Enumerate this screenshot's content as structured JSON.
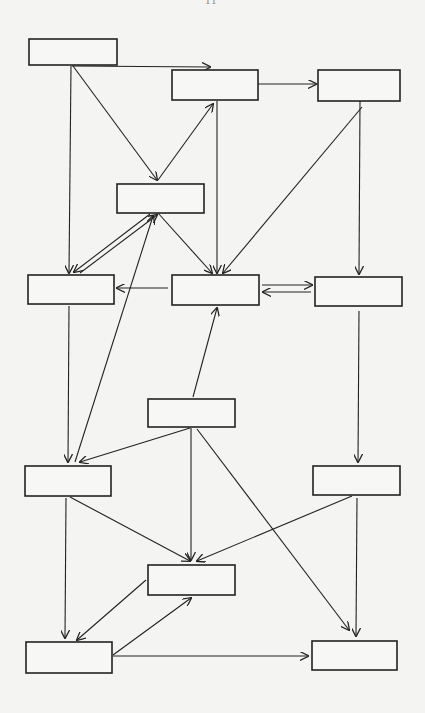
{
  "page_mark": "11",
  "diagram": {
    "type": "flow-diagram",
    "colors": {
      "background": "#f4f4f2",
      "stroke": "#222222",
      "box_fill": "#f7f7f5"
    },
    "nodes": [
      {
        "id": "A",
        "label": "",
        "x": 29,
        "y": 39,
        "w": 88,
        "h": 26
      },
      {
        "id": "B",
        "label": "",
        "x": 172,
        "y": 70,
        "w": 86,
        "h": 30
      },
      {
        "id": "C",
        "label": "",
        "x": 318,
        "y": 70,
        "w": 82,
        "h": 31
      },
      {
        "id": "D",
        "label": "",
        "x": 117,
        "y": 184,
        "w": 87,
        "h": 29
      },
      {
        "id": "E",
        "label": "",
        "x": 28,
        "y": 275,
        "w": 86,
        "h": 29
      },
      {
        "id": "F",
        "label": "",
        "x": 172,
        "y": 275,
        "w": 87,
        "h": 30
      },
      {
        "id": "G",
        "label": "",
        "x": 315,
        "y": 277,
        "w": 87,
        "h": 29
      },
      {
        "id": "M",
        "label": "",
        "x": 148,
        "y": 399,
        "w": 87,
        "h": 28
      },
      {
        "id": "H",
        "label": "",
        "x": 25,
        "y": 466,
        "w": 86,
        "h": 30
      },
      {
        "id": "R",
        "label": "",
        "x": 313,
        "y": 466,
        "w": 87,
        "h": 29
      },
      {
        "id": "N",
        "label": "",
        "x": 148,
        "y": 565,
        "w": 87,
        "h": 30
      },
      {
        "id": "BL",
        "label": "",
        "x": 26,
        "y": 642,
        "w": 86,
        "h": 31
      },
      {
        "id": "BR",
        "label": "",
        "x": 312,
        "y": 641,
        "w": 85,
        "h": 29
      }
    ],
    "edges": [
      {
        "from": "A",
        "to": "B",
        "x1": 72,
        "y1": 66,
        "x2": 210,
        "y2": 67
      },
      {
        "from": "A",
        "to": "D",
        "x1": 73,
        "y1": 66,
        "x2": 157,
        "y2": 180
      },
      {
        "from": "A",
        "to": "E",
        "x1": 71,
        "y1": 66,
        "x2": 69,
        "y2": 273
      },
      {
        "from": "D",
        "to": "B",
        "x1": 158,
        "y1": 180,
        "x2": 213,
        "y2": 104
      },
      {
        "from": "B",
        "to": "C",
        "x1": 258,
        "y1": 84,
        "x2": 316,
        "y2": 84
      },
      {
        "from": "B",
        "to": "F",
        "x1": 217,
        "y1": 101,
        "x2": 217,
        "y2": 273
      },
      {
        "from": "C",
        "to": "F",
        "x1": 362,
        "y1": 107,
        "x2": 223,
        "y2": 273
      },
      {
        "from": "C",
        "to": "G",
        "x1": 360,
        "y1": 101,
        "x2": 359,
        "y2": 274
      },
      {
        "from": "D",
        "to": "F",
        "x1": 158,
        "y1": 213,
        "x2": 212,
        "y2": 273
      },
      {
        "from": "D",
        "to": "E",
        "x1": 150,
        "y1": 214,
        "x2": 74,
        "y2": 272
      },
      {
        "from": "E",
        "to": "D",
        "x1": 80,
        "y1": 273,
        "x2": 157,
        "y2": 215
      },
      {
        "from": "F",
        "to": "E",
        "x1": 168,
        "y1": 288,
        "x2": 117,
        "y2": 288
      },
      {
        "from": "F",
        "to": "G",
        "x1": 262,
        "y1": 285,
        "x2": 312,
        "y2": 285
      },
      {
        "from": "G",
        "to": "F",
        "x1": 311,
        "y1": 292,
        "x2": 263,
        "y2": 292
      },
      {
        "from": "M",
        "to": "F",
        "x1": 193,
        "y1": 397,
        "x2": 217,
        "y2": 308
      },
      {
        "from": "H",
        "to": "D",
        "x1": 75,
        "y1": 462,
        "x2": 153,
        "y2": 216
      },
      {
        "from": "E",
        "to": "H",
        "x1": 69,
        "y1": 306,
        "x2": 68,
        "y2": 462
      },
      {
        "from": "M",
        "to": "H",
        "x1": 190,
        "y1": 428,
        "x2": 80,
        "y2": 462
      },
      {
        "from": "M",
        "to": "N",
        "x1": 191,
        "y1": 428,
        "x2": 191,
        "y2": 560
      },
      {
        "from": "M",
        "to": "BR",
        "x1": 197,
        "y1": 429,
        "x2": 349,
        "y2": 630
      },
      {
        "from": "G",
        "to": "R",
        "x1": 359,
        "y1": 311,
        "x2": 358,
        "y2": 462
      },
      {
        "from": "H",
        "to": "N",
        "x1": 70,
        "y1": 497,
        "x2": 190,
        "y2": 561
      },
      {
        "from": "R",
        "to": "N",
        "x1": 352,
        "y1": 496,
        "x2": 197,
        "y2": 561
      },
      {
        "from": "H",
        "to": "BL",
        "x1": 66,
        "y1": 498,
        "x2": 65,
        "y2": 638
      },
      {
        "from": "N",
        "to": "BL",
        "x1": 146,
        "y1": 580,
        "x2": 77,
        "y2": 640
      },
      {
        "from": "BL",
        "to": "N",
        "x1": 113,
        "y1": 655,
        "x2": 191,
        "y2": 598
      },
      {
        "from": "BL",
        "to": "BR",
        "x1": 113,
        "y1": 656,
        "x2": 308,
        "y2": 656
      },
      {
        "from": "R",
        "to": "BR",
        "x1": 357,
        "y1": 498,
        "x2": 356,
        "y2": 636
      }
    ]
  }
}
